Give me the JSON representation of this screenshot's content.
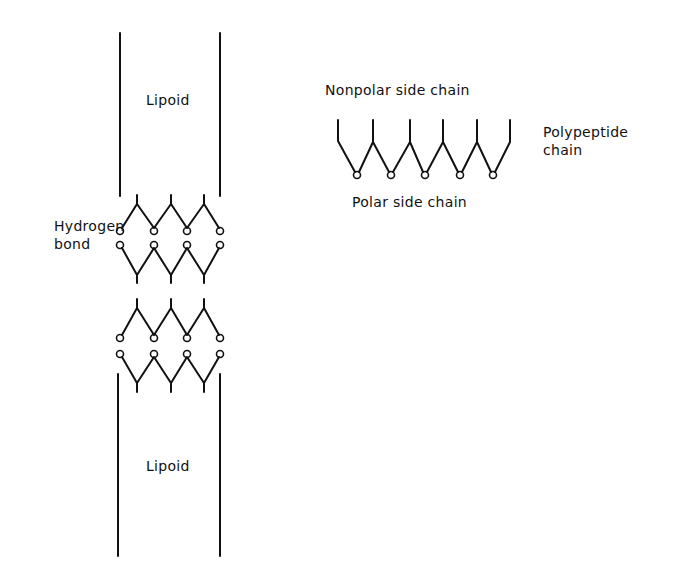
{
  "diagram": {
    "type": "membrane-structure",
    "labels": {
      "lipoid_top": "Lipoid",
      "lipoid_bottom": "Lipoid",
      "hydrogen_bond_line1": "Hydrogen",
      "hydrogen_bond_line2": "bond",
      "nonpolar": "Nonpolar side chain",
      "polar": "Polar side chain",
      "polypeptide_line1": "Polypeptide",
      "polypeptide_line2": "chain"
    },
    "colors": {
      "ink": "#111111",
      "background": "#ffffff"
    },
    "components": [
      {
        "id": "lipoid-top",
        "kind": "lipid-layer",
        "label": "Lipoid"
      },
      {
        "id": "chain-1",
        "kind": "polypeptide-chain",
        "orientation": "nonpolar-up",
        "polar_groups": 4
      },
      {
        "id": "chain-2",
        "kind": "polypeptide-chain",
        "orientation": "nonpolar-down",
        "polar_groups": 4
      },
      {
        "id": "chain-3",
        "kind": "polypeptide-chain",
        "orientation": "nonpolar-up",
        "polar_groups": 4
      },
      {
        "id": "chain-4",
        "kind": "polypeptide-chain",
        "orientation": "nonpolar-down",
        "polar_groups": 4
      },
      {
        "id": "lipoid-bottom",
        "kind": "lipid-layer",
        "label": "Lipoid"
      },
      {
        "id": "legend-chain",
        "kind": "polypeptide-chain",
        "nonpolar_side_chains": 6,
        "polar_side_chains": 5
      }
    ],
    "relations": [
      {
        "from": "chain-1",
        "to": "chain-2",
        "type": "hydrogen bond"
      },
      {
        "from": "chain-3",
        "to": "chain-4",
        "type": "hydrogen bond"
      }
    ]
  }
}
